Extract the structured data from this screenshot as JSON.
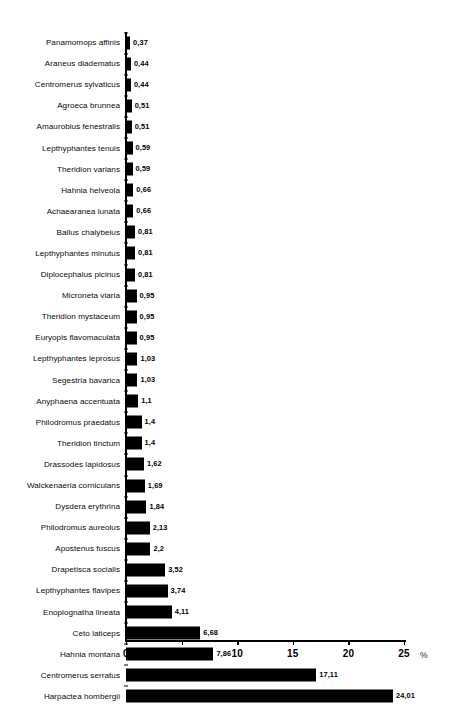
{
  "chart_data": {
    "type": "bar",
    "orientation": "horizontal",
    "title": "",
    "xlabel": "%",
    "ylabel": "",
    "xlim": [
      0,
      26.5
    ],
    "xticks": [
      0,
      5,
      10,
      15,
      20,
      25
    ],
    "xtick_labels": [
      "0",
      "5",
      "10",
      "15",
      "20",
      "25"
    ],
    "grid": false,
    "legend": null,
    "decimal_separator": ",",
    "bar_color": "#000000",
    "categories": [
      "Panamomops affinis",
      "Araneus diadematus",
      "Centromerus sylvaticus",
      "Agroeca brunnea",
      "Amaurobius fenestralis",
      "Lepthyphantes tenuis",
      "Theridion varians",
      "Hahnia helveola",
      "Achaearanea lunata",
      "Ballus chalybeius",
      "Lepthyphantes minutus",
      "Diplocephalus picinus",
      "Microneta viaria",
      "Theridion mystaceum",
      "Euryopis flavomaculata",
      "Lepthyphantes leprosus",
      "Segestria bavarica",
      "Anyphaena accentuata",
      "Philodromus praedatus",
      "Theridion tinctum",
      "Drassodes lapidosus",
      "Walckenaeria corniculans",
      "Dysdera erythrina",
      "Philodromus aureolus",
      "Apostenus fuscus",
      "Drapetisca socialis",
      "Lepthyphantes flavipes",
      "Enoplognatha lineata",
      "Ceto laticeps",
      "Hahnia montana",
      "Centromerus serratus",
      "Harpactea hombergii"
    ],
    "values": [
      0.37,
      0.44,
      0.44,
      0.51,
      0.51,
      0.59,
      0.59,
      0.66,
      0.66,
      0.81,
      0.81,
      0.81,
      0.95,
      0.95,
      0.95,
      1.03,
      1.03,
      1.1,
      1.4,
      1.4,
      1.62,
      1.69,
      1.84,
      2.13,
      2.2,
      3.52,
      3.74,
      4.11,
      6.68,
      7.86,
      17.11,
      24.01
    ],
    "value_labels": [
      "0,37",
      "0,44",
      "0,44",
      "0,51",
      "0,51",
      "0,59",
      "0,59",
      "0,66",
      "0,66",
      "0,81",
      "0,81",
      "0,81",
      "0,95",
      "0,95",
      "0,95",
      "1,03",
      "1,03",
      "1,1",
      "1,4",
      "1,4",
      "1,62",
      "1,69",
      "1,84",
      "2,13",
      "2,2",
      "3,52",
      "3,74",
      "4,11",
      "6,68",
      "7,86",
      "17,11",
      "24,01"
    ]
  }
}
